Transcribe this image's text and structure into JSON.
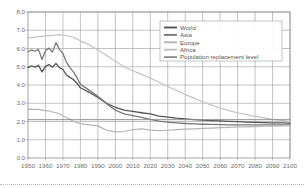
{
  "chart_data": {
    "type": "line",
    "title": "",
    "subtitle": "",
    "xlabel": "",
    "ylabel": "",
    "xlim": [
      1950,
      2100
    ],
    "ylim": [
      0.0,
      8.0
    ],
    "grid": true,
    "legend_position": "top-right",
    "y_ticks": [
      "0.0",
      "1.0",
      "2.0",
      "3.0",
      "4.0",
      "5.0",
      "6.0",
      "7.0",
      "8.0"
    ],
    "y_tick_values": [
      0.0,
      1.0,
      2.0,
      3.0,
      4.0,
      5.0,
      6.0,
      7.0,
      8.0
    ],
    "x_ticks": [
      "1950",
      "1960",
      "1970",
      "1980",
      "1990",
      "2000",
      "2010",
      "2020",
      "2030",
      "2040",
      "2050",
      "2060",
      "2070",
      "2080",
      "2090",
      "2100"
    ],
    "x_tick_values": [
      1950,
      1960,
      1970,
      1980,
      1990,
      2000,
      2010,
      2020,
      2030,
      2040,
      2050,
      2060,
      2070,
      2080,
      2090,
      2100
    ],
    "x": [
      1950,
      1952,
      1954,
      1956,
      1958,
      1960,
      1962,
      1964,
      1966,
      1968,
      1970,
      1972,
      1974,
      1976,
      1978,
      1980,
      1985,
      1990,
      1995,
      2000,
      2005,
      2010,
      2015,
      2020,
      2025,
      2030,
      2035,
      2040,
      2045,
      2050,
      2055,
      2060,
      2065,
      2070,
      2075,
      2080,
      2085,
      2090,
      2095,
      2100
    ],
    "series": [
      {
        "name": "World",
        "color": "#555555",
        "values": [
          4.95,
          5.05,
          4.98,
          5.08,
          4.72,
          5.02,
          5.12,
          4.98,
          5.18,
          4.95,
          4.85,
          4.55,
          4.42,
          4.3,
          4.1,
          3.85,
          3.6,
          3.32,
          3.0,
          2.78,
          2.62,
          2.55,
          2.48,
          2.42,
          2.3,
          2.24,
          2.18,
          2.14,
          2.1,
          2.08,
          2.05,
          2.03,
          2.01,
          1.99,
          1.97,
          1.95,
          1.94,
          1.93,
          1.92,
          1.91
        ]
      },
      {
        "name": "Asia",
        "color": "#7a7a7a",
        "values": [
          5.82,
          5.92,
          5.85,
          5.95,
          5.4,
          5.88,
          6.02,
          5.8,
          6.32,
          5.95,
          5.72,
          5.25,
          4.95,
          4.72,
          4.4,
          4.05,
          3.72,
          3.38,
          2.98,
          2.62,
          2.42,
          2.32,
          2.22,
          2.12,
          2.02,
          1.96,
          1.92,
          1.89,
          1.87,
          1.85,
          1.84,
          1.83,
          1.82,
          1.82,
          1.81,
          1.81,
          1.81,
          1.81,
          1.82,
          1.82
        ]
      },
      {
        "name": "Europe",
        "color": "#b5b5b5",
        "values": [
          2.66,
          2.68,
          2.65,
          2.68,
          2.62,
          2.6,
          2.58,
          2.52,
          2.48,
          2.42,
          2.32,
          2.22,
          2.12,
          2.02,
          1.94,
          1.88,
          1.82,
          1.76,
          1.52,
          1.43,
          1.45,
          1.56,
          1.6,
          1.53,
          1.5,
          1.52,
          1.55,
          1.58,
          1.6,
          1.62,
          1.64,
          1.66,
          1.68,
          1.7,
          1.71,
          1.72,
          1.74,
          1.75,
          1.76,
          1.77
        ]
      },
      {
        "name": "Africa",
        "color": "#c2c2c2",
        "values": [
          6.58,
          6.6,
          6.62,
          6.64,
          6.66,
          6.68,
          6.7,
          6.72,
          6.74,
          6.76,
          6.74,
          6.7,
          6.66,
          6.6,
          6.52,
          6.42,
          6.2,
          5.92,
          5.62,
          5.3,
          5.0,
          4.78,
          4.58,
          4.38,
          4.15,
          3.92,
          3.7,
          3.48,
          3.28,
          3.08,
          2.9,
          2.74,
          2.6,
          2.48,
          2.38,
          2.28,
          2.2,
          2.12,
          2.06,
          2.0
        ]
      },
      {
        "name": "Population replacement level",
        "color": "#8f8f8f",
        "values": [
          2.1,
          2.1,
          2.1,
          2.1,
          2.1,
          2.1,
          2.1,
          2.1,
          2.1,
          2.1,
          2.1,
          2.1,
          2.1,
          2.1,
          2.1,
          2.1,
          2.1,
          2.1,
          2.1,
          2.1,
          2.1,
          2.1,
          2.1,
          2.1,
          2.1,
          2.1,
          2.1,
          2.1,
          2.1,
          2.1,
          2.1,
          2.1,
          2.1,
          2.1,
          2.1,
          2.1,
          2.1,
          2.1,
          2.1,
          2.1
        ]
      }
    ]
  },
  "legend": {
    "items": [
      {
        "label": "World"
      },
      {
        "label": "Asia"
      },
      {
        "label": "Europe"
      },
      {
        "label": "Africa"
      },
      {
        "label": "Population replacement level"
      }
    ]
  },
  "colors": {
    "grid": "#9a9a9a",
    "frame": "#8c8c8c",
    "tick_text": "#6e6e6e",
    "legend_text": "#555555",
    "background": "#ffffff",
    "bottom_rule": "#b9b9b9"
  }
}
